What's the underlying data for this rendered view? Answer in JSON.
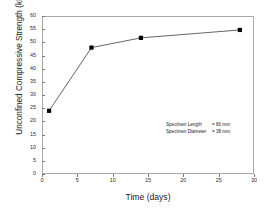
{
  "chart_data": {
    "type": "line",
    "title": "",
    "xlabel": "Time (days)",
    "ylabel": "Unconfined Compressive Strength (kPa)",
    "xlim": [
      0,
      30
    ],
    "ylim": [
      0,
      60
    ],
    "xticks": [
      0,
      5,
      10,
      15,
      20,
      25,
      30
    ],
    "yticks": [
      0,
      5,
      10,
      15,
      20,
      25,
      30,
      35,
      40,
      45,
      50,
      55,
      60
    ],
    "grid": false,
    "legend": null,
    "marker": "filled-square",
    "marker_color": "#000000",
    "line_color": "#555555",
    "series": [
      {
        "name": "Unconfined Compressive Strength",
        "x": [
          1,
          7,
          14,
          28
        ],
        "values": [
          24,
          48,
          51.7,
          54.7
        ]
      }
    ],
    "annotations": [
      {
        "key": "Specimen Length",
        "value": "= 80 mm"
      },
      {
        "key": "Specimen Diameter",
        "value": "= 38 mm"
      }
    ]
  },
  "axes": {
    "x_title": "Time (days)",
    "y_title": "Unconfined Compressive Strength (kPa)",
    "x_tick_labels": [
      "0",
      "5",
      "10",
      "15",
      "20",
      "25",
      "30"
    ],
    "y_tick_labels": [
      "0",
      "5",
      "10",
      "15",
      "20",
      "25",
      "30",
      "35",
      "40",
      "45",
      "50",
      "55",
      "60"
    ]
  },
  "annotation": {
    "line1_key": "Specimen Length",
    "line1_value": "= 80 mm",
    "line2_key": "Specimen Diameter",
    "line2_value": "= 38 mm"
  },
  "colors": {
    "frame": "#a8a8a8",
    "line": "#555555",
    "marker": "#000000",
    "text": "#1a1a1a",
    "background": "#ffffff"
  }
}
